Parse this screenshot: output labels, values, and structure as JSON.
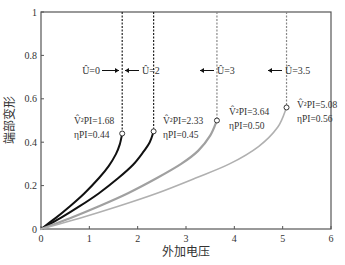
{
  "chart_data": {
    "type": "line",
    "title": "",
    "xlabel": "外加电压",
    "ylabel": "端部变形",
    "xlim": [
      0,
      6
    ],
    "ylim": [
      0,
      1
    ],
    "xticks": [
      0,
      1,
      2,
      3,
      4,
      5,
      6
    ],
    "yticks": [
      0,
      0.2,
      0.4,
      0.6,
      0.8,
      1
    ],
    "ytick_labels": [
      "0",
      "0.2",
      "0.4",
      "0.6",
      "0.8",
      "1"
    ],
    "grid": false,
    "legend": "none (inline annotations)",
    "series": [
      {
        "name": "Û=0",
        "color": "#111111",
        "width": 2,
        "end_point": {
          "x": 1.68,
          "y": 0.44
        },
        "points": [
          [
            0,
            0
          ],
          [
            0.3,
            0.05
          ],
          [
            0.6,
            0.105
          ],
          [
            0.9,
            0.165
          ],
          [
            1.2,
            0.235
          ],
          [
            1.4,
            0.29
          ],
          [
            1.55,
            0.345
          ],
          [
            1.63,
            0.39
          ],
          [
            1.68,
            0.44
          ]
        ],
        "pull_in_line_x": 1.68,
        "annotation_label": "Û=0",
        "annotation_v": "V̂²PI=1.68",
        "annotation_eta": "ηPI=0.44"
      },
      {
        "name": "Û=2",
        "color": "#111111",
        "width": 2,
        "end_point": {
          "x": 2.33,
          "y": 0.45
        },
        "points": [
          [
            0,
            0
          ],
          [
            0.4,
            0.05
          ],
          [
            0.8,
            0.105
          ],
          [
            1.2,
            0.165
          ],
          [
            1.6,
            0.235
          ],
          [
            1.9,
            0.295
          ],
          [
            2.1,
            0.35
          ],
          [
            2.25,
            0.4
          ],
          [
            2.33,
            0.45
          ]
        ],
        "pull_in_line_x": 2.33,
        "annotation_label": "Û=2",
        "annotation_v": "V̂²PI=2.33",
        "annotation_eta": "ηPI=0.45"
      },
      {
        "name": "Û=3",
        "color": "#a0a0a0",
        "width": 2.2,
        "end_point": {
          "x": 3.64,
          "y": 0.5
        },
        "points": [
          [
            0,
            0
          ],
          [
            0.6,
            0.05
          ],
          [
            1.2,
            0.105
          ],
          [
            1.8,
            0.165
          ],
          [
            2.4,
            0.235
          ],
          [
            2.9,
            0.3
          ],
          [
            3.25,
            0.36
          ],
          [
            3.5,
            0.43
          ],
          [
            3.64,
            0.5
          ]
        ],
        "pull_in_line_x": 3.64,
        "annotation_label": "Û=3",
        "annotation_v": "V̂²PI=3.64",
        "annotation_eta": "ηPI=0.50"
      },
      {
        "name": "Û=3.5",
        "color": "#b0b0b0",
        "width": 1.6,
        "end_point": {
          "x": 5.08,
          "y": 0.56
        },
        "points": [
          [
            0,
            0
          ],
          [
            0.8,
            0.05
          ],
          [
            1.6,
            0.105
          ],
          [
            2.4,
            0.165
          ],
          [
            3.2,
            0.235
          ],
          [
            3.9,
            0.3
          ],
          [
            4.5,
            0.38
          ],
          [
            4.9,
            0.47
          ],
          [
            5.08,
            0.56
          ]
        ],
        "pull_in_line_x": 5.08,
        "annotation_label": "Û=3.5",
        "annotation_v": "V̂²PI=5.08",
        "annotation_eta": "ηPI=0.56"
      }
    ]
  },
  "axes": {
    "xlabel": "外加电压",
    "ylabel": "端部变形"
  },
  "annotations": [
    {
      "label": "Û=0",
      "arrow": "right",
      "x_px": 72,
      "y_px": 71
    },
    {
      "label": "Û=2",
      "arrow": "left",
      "x_px": 140,
      "y_px": 71
    },
    {
      "label": "Û=3",
      "arrow": "left",
      "x_px": 222,
      "y_px": 71
    },
    {
      "label": "Û=3.5",
      "arrow": "left",
      "x_px": 295,
      "y_px": 71
    }
  ]
}
